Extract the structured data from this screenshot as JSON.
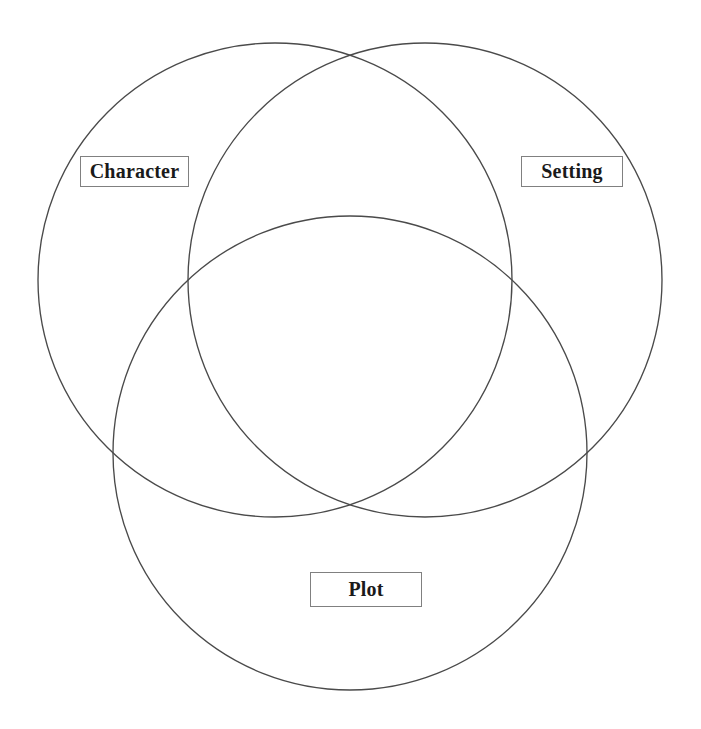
{
  "page": {
    "background_color": "#ffffff",
    "width": 701,
    "height": 729
  },
  "diagram": {
    "type": "venn-3-circle",
    "stroke_color": "#4a4a4a",
    "stroke_width": 1.35,
    "fill": "none",
    "circles": [
      {
        "id": "character",
        "label": "Character",
        "cx": 275,
        "cy": 280,
        "r": 237
      },
      {
        "id": "setting",
        "label": "Setting",
        "cx": 425,
        "cy": 280,
        "r": 237
      },
      {
        "id": "plot",
        "label": "Plot",
        "cx": 350,
        "cy": 453,
        "r": 237
      }
    ]
  },
  "labels": {
    "character": "Character",
    "setting": "Setting",
    "plot": "Plot",
    "box_border_color": "#808080",
    "box_background": "#ffffff",
    "text_color": "#1a1a1a"
  }
}
